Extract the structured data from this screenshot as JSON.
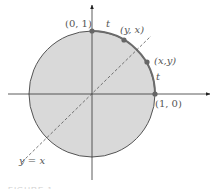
{
  "diagram": {
    "type": "unit-circle",
    "colors": {
      "disk_fill": "#d9d9d9",
      "circle_stroke": "#555555",
      "arc_highlight": "#6b6b6b",
      "axis": "#333333",
      "point": "#666666",
      "dashed_line": "#555555",
      "label": "#555555"
    },
    "labels": {
      "top_point": "(0, 1)",
      "right_point": "(1, 0)",
      "point_yx": "(y, x)",
      "point_xy": "(x,y)",
      "arc_top": "t",
      "arc_right": "t",
      "line": "y = x"
    },
    "caption": "FIGURE 1"
  }
}
